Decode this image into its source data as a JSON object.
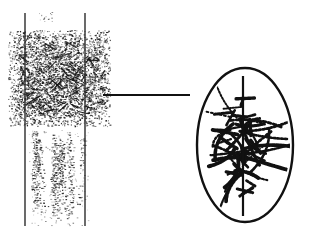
{
  "figure": {
    "title": "",
    "background_color": "#ffffff",
    "ink_color": "#111111",
    "width": 313,
    "height": 239,
    "panels": [
      {
        "name": "left-panel",
        "label": "",
        "description": "noise-band-with-vertical-guides"
      },
      {
        "name": "right-panel",
        "label": "",
        "description": "ellipse-with-radiating-dashed-strokes"
      }
    ]
  },
  "left_panel": {
    "name": "noise-band",
    "guide_lines": [
      {
        "name": "left-guide-line",
        "x": 25,
        "y1": 13,
        "y2": 226,
        "width": 1.4,
        "color": "#2b2b2b"
      },
      {
        "name": "right-guide-line",
        "x": 85,
        "y1": 13,
        "y2": 226,
        "width": 1.4,
        "color": "#2b2b2b"
      }
    ],
    "dense_region": {
      "name": "dense-speckle-block",
      "x": 8,
      "y": 30,
      "width": 102,
      "height": 96,
      "dot_count": 5200,
      "dot_color": "#141414",
      "density": "high"
    },
    "sparse_region": {
      "name": "sparse-speckle-block",
      "x": 28,
      "y": 130,
      "width": 60,
      "height": 96,
      "dot_count": 520,
      "dot_color": "#1c1c1c",
      "density": "low"
    },
    "top_marks": {
      "name": "top-speckle-marks",
      "x": 38,
      "y": 12,
      "width": 14,
      "height": 10,
      "dot_count": 14,
      "dot_color": "#303030"
    }
  },
  "connector": {
    "name": "connector-line",
    "x1": 103,
    "y1": 95,
    "x2": 190,
    "y2": 95,
    "width": 1.8,
    "color": "#111111"
  },
  "right_panel": {
    "name": "ellipse-diagram",
    "ellipse": {
      "name": "ellipse-outline",
      "cx": 245,
      "cy": 145,
      "rx": 48,
      "ry": 77,
      "stroke_width": 2.4,
      "stroke_color": "#111111",
      "fill": "none"
    },
    "axis_line": {
      "name": "ellipse-axis-line",
      "x": 243,
      "y1": 76,
      "y2": 216,
      "width": 2.2,
      "color": "#111111"
    },
    "strokes": {
      "name": "radiating-dashed-strokes",
      "count": 34,
      "color": "#111111",
      "style": "dotted-dashed",
      "origin_spread": 22,
      "description": "short dashed chromatin-like filaments radiating from center region"
    }
  },
  "chart_data": {
    "type": "scatter",
    "title": "",
    "xlabel": "",
    "ylabel": "",
    "series": [
      {
        "name": "dense-speckle-field",
        "region": "left-upper",
        "point_count": 5200,
        "bounds": [
          8,
          30,
          110,
          126
        ]
      },
      {
        "name": "sparse-speckle-field",
        "region": "left-lower",
        "point_count": 520,
        "bounds": [
          28,
          130,
          88,
          226
        ]
      },
      {
        "name": "ellipse-filament-dashes",
        "region": "right",
        "point_count": 34,
        "bounds": [
          197,
          68,
          293,
          222
        ]
      }
    ],
    "grid": false,
    "legend": "none"
  }
}
